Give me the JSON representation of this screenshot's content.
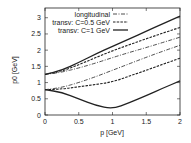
{
  "chart_data": {
    "type": "line",
    "title": "",
    "xlabel": "p [GeV]",
    "ylabel": "p0 [GeV]",
    "xlim": [
      0,
      2
    ],
    "ylim": [
      0,
      3.3
    ],
    "xticks": [
      "0",
      "0.5",
      "1",
      "1.5",
      "2"
    ],
    "yticks": [
      "0",
      "0.5",
      "1",
      "1.5",
      "2",
      "2.5",
      "3"
    ],
    "grid": false,
    "legend_position": "top-left-inside",
    "x": [
      0,
      0.25,
      0.5,
      0.75,
      1.0,
      1.25,
      1.5,
      1.75,
      2.0
    ],
    "series": [
      {
        "name": "longitudinal",
        "style": "dash-dot",
        "branch": "upper",
        "values": [
          1.25,
          1.32,
          1.45,
          1.6,
          1.77,
          1.93,
          2.08,
          2.24,
          2.4
        ]
      },
      {
        "name": "longitudinal",
        "style": "dash-dot",
        "branch": "lower",
        "values": [
          0.78,
          0.85,
          1.0,
          1.18,
          1.38,
          1.58,
          1.78,
          1.97,
          2.15
        ]
      },
      {
        "name": "transv: C=0.5 GeV",
        "style": "dashed",
        "branch": "upper",
        "values": [
          1.25,
          1.35,
          1.55,
          1.77,
          1.98,
          2.17,
          2.35,
          2.53,
          2.7
        ]
      },
      {
        "name": "transv: C=0.5 GeV",
        "style": "dashed",
        "branch": "lower",
        "values": [
          0.78,
          0.8,
          0.87,
          0.94,
          1.02,
          1.2,
          1.38,
          1.57,
          1.75
        ]
      },
      {
        "name": "transv: C=1 GeV",
        "style": "solid",
        "branch": "upper",
        "values": [
          1.25,
          1.38,
          1.62,
          1.88,
          2.12,
          2.35,
          2.58,
          2.82,
          3.05
        ]
      },
      {
        "name": "transv: C=1 GeV",
        "style": "solid",
        "branch": "lower",
        "values": [
          0.78,
          0.7,
          0.5,
          0.3,
          0.18,
          0.38,
          0.6,
          0.83,
          1.05
        ]
      }
    ],
    "legend": [
      "longitudinal",
      "transv: C=0.5 GeV",
      "transv: C=1 GeV"
    ]
  }
}
